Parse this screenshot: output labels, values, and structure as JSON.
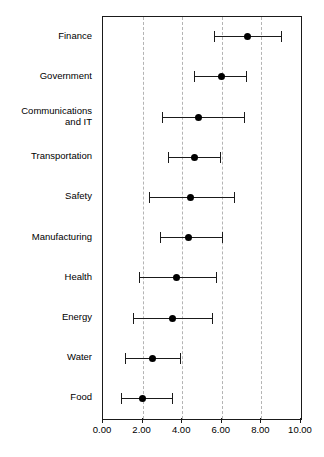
{
  "chart_data": {
    "type": "scatter",
    "subtype": "dot-and-whisker",
    "title": "",
    "xlabel": "",
    "ylabel": "",
    "xlim": [
      0.0,
      10.0
    ],
    "xticks": [
      0.0,
      2.0,
      4.0,
      6.0,
      8.0,
      10.0
    ],
    "xticklabels": [
      "0.00",
      "2.00",
      "4.00",
      "6.00",
      "8.00",
      "10.00"
    ],
    "grid": "vertical-dashed",
    "gridlines": [
      2.0,
      4.0,
      6.0,
      8.0
    ],
    "legend": "none",
    "marker_color": "#000000",
    "line_color": "#1a1a1a",
    "grid_color": "#b4b4b4",
    "categories": [
      "Finance",
      "Government",
      "Communications\nand IT",
      "Transportation",
      "Safety",
      "Manufacturing",
      "Health",
      "Energy",
      "Water",
      "Food"
    ],
    "values": [
      7.3,
      6.0,
      4.8,
      4.6,
      4.4,
      4.3,
      3.7,
      3.5,
      2.5,
      2.0
    ],
    "low": [
      5.6,
      4.6,
      3.0,
      3.3,
      2.3,
      2.9,
      1.8,
      1.5,
      1.1,
      0.9
    ],
    "high": [
      9.0,
      7.2,
      7.1,
      5.9,
      6.6,
      6.0,
      5.7,
      5.5,
      3.9,
      3.5
    ],
    "points": [
      {
        "category": "Finance",
        "value": 7.3,
        "low": 5.6,
        "high": 9.0
      },
      {
        "category": "Government",
        "value": 6.0,
        "low": 4.6,
        "high": 7.2
      },
      {
        "category": "Communications and IT",
        "value": 4.8,
        "low": 3.0,
        "high": 7.1
      },
      {
        "category": "Transportation",
        "value": 4.6,
        "low": 3.3,
        "high": 5.9
      },
      {
        "category": "Safety",
        "value": 4.4,
        "low": 2.3,
        "high": 6.6
      },
      {
        "category": "Manufacturing",
        "value": 4.3,
        "low": 2.9,
        "high": 6.0
      },
      {
        "category": "Health",
        "value": 3.7,
        "low": 1.8,
        "high": 5.7
      },
      {
        "category": "Energy",
        "value": 3.5,
        "low": 1.5,
        "high": 5.5
      },
      {
        "category": "Water",
        "value": 2.5,
        "low": 1.1,
        "high": 3.9
      },
      {
        "category": "Food",
        "value": 2.0,
        "low": 0.9,
        "high": 3.5
      }
    ]
  }
}
